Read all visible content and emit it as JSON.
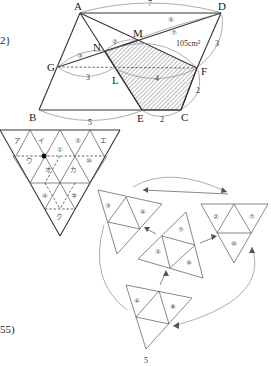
{
  "side_text": {
    "top_fragment": "2}",
    "bottom_fragment": "55)"
  },
  "figure1": {
    "points": {
      "A": "A",
      "D": "D",
      "M": "M",
      "N": "N",
      "G": "G",
      "L": "L",
      "F": "F",
      "B": "B",
      "E": "E",
      "C": "C"
    },
    "measures": {
      "AD": "7",
      "MD_ratio": "⑤",
      "NM_ratio": "②",
      "GN_ratio": "③",
      "NF_ratio": "⑦",
      "area": "105cm²",
      "DF": "3",
      "GL": "3",
      "LF": "4",
      "FC": "2",
      "BE": "5",
      "EC": "2"
    }
  },
  "figure2": {
    "top_row": [
      "ア",
      "イ",
      "①",
      "②",
      "エ"
    ],
    "middle_row": [
      "ウ",
      "オ",
      "カ",
      "⑩"
    ],
    "lower_row": [
      "④",
      "キ"
    ],
    "bottom": [
      "ク"
    ]
  },
  "figure3": {
    "pieces": [
      {
        "name": "upper-left",
        "labels": [
          "③",
          "⑥"
        ]
      },
      {
        "name": "center",
        "labels": [
          "⑦",
          "⑤",
          "⑨"
        ]
      },
      {
        "name": "right",
        "labels": [
          "②",
          "⑦",
          "⑩"
        ]
      },
      {
        "name": "bottom",
        "labels": [
          "④",
          "⑧"
        ]
      }
    ],
    "footer_number": "5"
  }
}
